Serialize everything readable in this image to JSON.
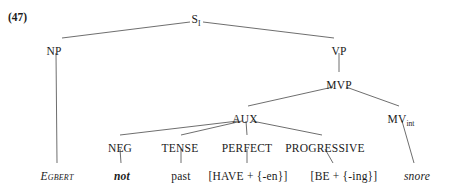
{
  "example": {
    "label": "(47)"
  },
  "tree": {
    "nodes": [
      {
        "id": "s",
        "label": "S",
        "sub": "I",
        "x": 196,
        "y": 13
      },
      {
        "id": "np",
        "label": "NP",
        "sub": "",
        "x": 54,
        "y": 45
      },
      {
        "id": "vp",
        "label": "VP",
        "sub": "",
        "x": 339,
        "y": 45
      },
      {
        "id": "mvp",
        "label": "MVP",
        "sub": "",
        "x": 339,
        "y": 79
      },
      {
        "id": "aux",
        "label": "AUX",
        "sub": "",
        "x": 245,
        "y": 113
      },
      {
        "id": "mv",
        "label": "MV",
        "sub": "int",
        "x": 401,
        "y": 113
      },
      {
        "id": "neg",
        "label": "NEG",
        "sub": "",
        "x": 120,
        "y": 142
      },
      {
        "id": "tense",
        "label": "TENSE",
        "sub": "",
        "x": 180,
        "y": 142
      },
      {
        "id": "perfect",
        "label": "PERFECT",
        "sub": "",
        "x": 247,
        "y": 142
      },
      {
        "id": "progressive",
        "label": "PROGRESSIVE",
        "sub": "",
        "x": 325,
        "y": 142
      }
    ],
    "terminals": [
      {
        "id": "egbert",
        "text": "Egbert",
        "style": "term-smallcap-first",
        "x": 57,
        "y": 170
      },
      {
        "id": "not",
        "text": "not",
        "style": "term-bolditalic",
        "x": 122,
        "y": 170
      },
      {
        "id": "past",
        "text": "past",
        "style": "",
        "x": 181,
        "y": 170
      },
      {
        "id": "have-en",
        "text": "[HAVE + {-en}]",
        "style": "",
        "x": 248,
        "y": 170
      },
      {
        "id": "be-ing",
        "text": "[BE + {-ing}]",
        "style": "",
        "x": 344,
        "y": 170
      },
      {
        "id": "snore",
        "text": "snore",
        "style": "term-italic",
        "x": 417,
        "y": 170
      }
    ],
    "edges": [
      {
        "id": "s-np",
        "x1": 190,
        "y1": 22,
        "x2": 62,
        "y2": 38
      },
      {
        "id": "s-vp",
        "x1": 203,
        "y1": 22,
        "x2": 334,
        "y2": 38
      },
      {
        "id": "np-egbert",
        "x1": 56,
        "y1": 53,
        "x2": 57,
        "y2": 163
      },
      {
        "id": "vp-mvp",
        "x1": 339,
        "y1": 53,
        "x2": 339,
        "y2": 72
      },
      {
        "id": "mvp-aux",
        "x1": 333,
        "y1": 87,
        "x2": 248,
        "y2": 106
      },
      {
        "id": "mvp-mv",
        "x1": 346,
        "y1": 87,
        "x2": 399,
        "y2": 106
      },
      {
        "id": "aux-neg",
        "x1": 238,
        "y1": 121,
        "x2": 120,
        "y2": 135
      },
      {
        "id": "aux-tense",
        "x1": 242,
        "y1": 121,
        "x2": 181,
        "y2": 135
      },
      {
        "id": "aux-perfect",
        "x1": 246,
        "y1": 121,
        "x2": 247,
        "y2": 135
      },
      {
        "id": "aux-progressive",
        "x1": 252,
        "y1": 121,
        "x2": 322,
        "y2": 135
      },
      {
        "id": "mv-snore",
        "x1": 402,
        "y1": 121,
        "x2": 414,
        "y2": 163
      },
      {
        "id": "neg-not",
        "x1": 120,
        "y1": 149,
        "x2": 121,
        "y2": 163
      },
      {
        "id": "tense-past",
        "x1": 181,
        "y1": 149,
        "x2": 181,
        "y2": 163
      },
      {
        "id": "perfect-have",
        "x1": 247,
        "y1": 149,
        "x2": 247,
        "y2": 163
      },
      {
        "id": "progressive-be",
        "x1": 325,
        "y1": 149,
        "x2": 333,
        "y2": 163
      }
    ]
  },
  "colors": {
    "background": "#ffffff",
    "text": "#1b1b1b",
    "line": "#5d5d5d"
  }
}
